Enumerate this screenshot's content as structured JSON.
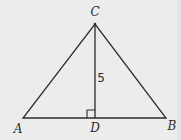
{
  "diagram": {
    "type": "geometry-triangle",
    "stroke_color": "#2b2b2b",
    "background_color": "#ececec",
    "points": {
      "A": {
        "x": 23,
        "y": 118
      },
      "B": {
        "x": 166,
        "y": 118
      },
      "C": {
        "x": 95,
        "y": 24
      },
      "D": {
        "x": 95,
        "y": 118
      }
    },
    "segments": [
      "AB",
      "BC",
      "CA",
      "CD"
    ],
    "right_angle_at": "D",
    "labels": {
      "A": "A",
      "B": "B",
      "C": "C",
      "D": "D"
    },
    "measurements": {
      "CD": "5"
    }
  }
}
